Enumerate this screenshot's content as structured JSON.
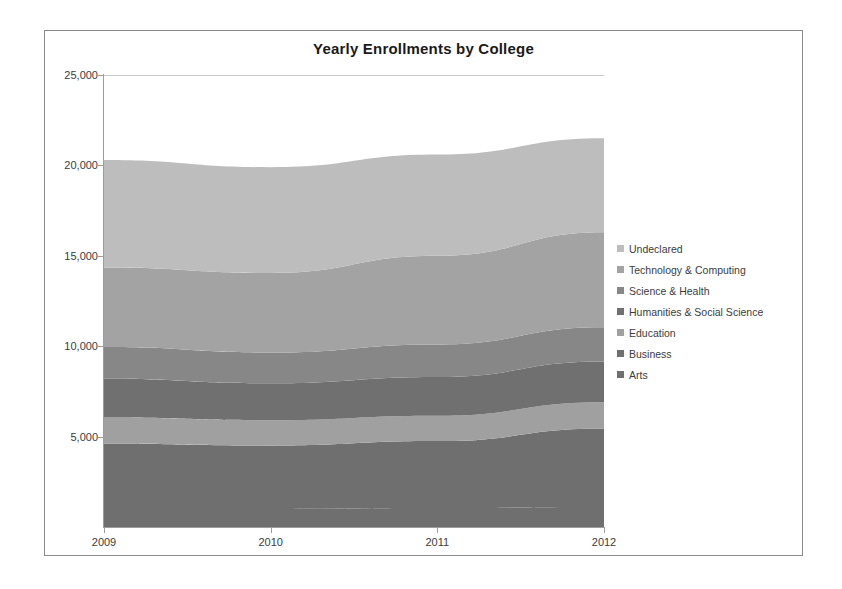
{
  "chart_data": {
    "type": "area",
    "stacked": true,
    "title": "Yearly Enrollments by College",
    "xlabel": "",
    "ylabel": "",
    "x": [
      2009,
      2010,
      2011,
      2012
    ],
    "categories": [
      "2009",
      "2010",
      "2011",
      "2012"
    ],
    "xtick_labels": [
      "2009",
      "2010",
      "2011",
      "2012"
    ],
    "ytick_labels": [
      "5,000",
      "10,000",
      "15,000",
      "20,000",
      "25,000"
    ],
    "ytick_values": [
      5000,
      10000,
      15000,
      20000,
      25000
    ],
    "ylim": [
      0,
      25000
    ],
    "xlim": [
      2009,
      2012
    ],
    "grid": false,
    "legend_position": "right",
    "series": [
      {
        "name": "Arts",
        "values": [
          1000,
          1000,
          1050,
          1100
        ],
        "color": "#6f6f6f"
      },
      {
        "name": "Business",
        "values": [
          3600,
          3500,
          3700,
          4350
        ],
        "color": "#6f6f6f"
      },
      {
        "name": "Education",
        "values": [
          1450,
          1400,
          1400,
          1450
        ],
        "color": "#a0a0a0"
      },
      {
        "name": "Humanities & Social Science",
        "values": [
          2150,
          2050,
          2150,
          2250
        ],
        "color": "#707070"
      },
      {
        "name": "Science & Health",
        "values": [
          1750,
          1700,
          1800,
          1900
        ],
        "color": "#878787"
      },
      {
        "name": "Technology & Computing",
        "values": [
          4400,
          4400,
          4900,
          5250
        ],
        "color": "#a3a3a3"
      },
      {
        "name": "Undeclared",
        "values": [
          5950,
          5850,
          5600,
          5200
        ],
        "color": "#bdbdbd"
      }
    ],
    "cumulative_tops": [
      20300,
      19900,
      20600,
      21500
    ]
  },
  "legend": {
    "items": [
      {
        "label": "Undeclared",
        "color": "#bdbdbd"
      },
      {
        "label": "Technology & Computing",
        "color": "#a3a3a3"
      },
      {
        "label": "Science & Health",
        "color": "#878787"
      },
      {
        "label": "Humanities & Social Science",
        "color": "#707070"
      },
      {
        "label": "Education",
        "color": "#a0a0a0"
      },
      {
        "label": "Business",
        "color": "#6f6f6f"
      },
      {
        "label": "Arts",
        "color": "#6f6f6f"
      }
    ]
  }
}
